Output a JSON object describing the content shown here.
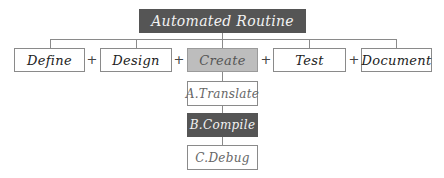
{
  "title": "Automated Routine",
  "steps": [
    {
      "label": "Define"
    },
    {
      "label": "Design"
    },
    {
      "label": "Create",
      "highlighted": true
    },
    {
      "label": "Test"
    },
    {
      "label": "Document"
    }
  ],
  "separator": "+",
  "create_substeps": [
    {
      "label": "A.Translate"
    },
    {
      "label": "B.Compile",
      "highlighted": true
    },
    {
      "label": "C.Debug"
    }
  ],
  "colors": {
    "title_fill": "#555555",
    "highlight_fill": "#bdbdbd",
    "substep_highlight_fill": "#555555",
    "line": "#8a8a8a"
  }
}
